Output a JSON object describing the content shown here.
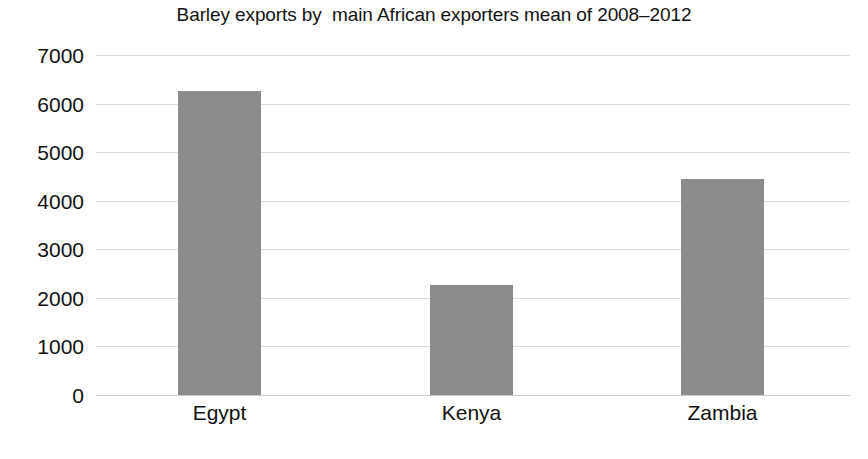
{
  "chart_data": {
    "type": "bar",
    "title": "Barley exports by  main African exporters mean of 2008–2012",
    "xlabel": "",
    "ylabel": "",
    "categories": [
      "Egypt",
      "Kenya",
      "Zambia"
    ],
    "values": [
      6250,
      2270,
      4450
    ],
    "series": [
      {
        "name": "Barley exports",
        "values": [
          6250,
          2270,
          4450
        ]
      }
    ],
    "ylim": [
      0,
      7000
    ],
    "ytick_labels": [
      "0",
      "1000",
      "2000",
      "3000",
      "4000",
      "5000",
      "6000",
      "7000"
    ],
    "ytick_values": [
      0,
      1000,
      2000,
      3000,
      4000,
      5000,
      6000,
      7000
    ],
    "grid": true,
    "grid_axis": "y",
    "legend": false,
    "legend_position": "none",
    "bar_color": "#8c8c8c",
    "gridline_color": "#d8d8d8",
    "background_color": "#ffffff",
    "text_color": "#111111"
  },
  "footer": {
    "sliver_text": ""
  }
}
